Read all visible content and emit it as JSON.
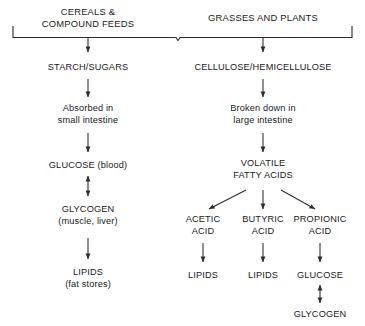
{
  "diagram": {
    "type": "flowchart",
    "background_color": "#ffffff",
    "line_color": "#2b2b2b",
    "text_color": "#1a1a1a"
  },
  "sources": {
    "left": {
      "line1": "CEREALS &",
      "line2": "COMPOUND FEEDS"
    },
    "right": {
      "line1": "GRASSES AND PLANTS",
      "line2": ""
    }
  },
  "left_branch": {
    "step1": {
      "line1": "STARCH/SUGARS",
      "line2": ""
    },
    "step2": {
      "line1": "Absorbed in",
      "line2": "small intestine"
    },
    "step3": {
      "line1": "GLUCOSE (blood)",
      "line2": ""
    },
    "step4": {
      "line1": "GLYCOGEN",
      "line2": "(muscle, liver)"
    },
    "step5": {
      "line1": "LIPIDS",
      "line2": "(fat stores)"
    }
  },
  "right_branch": {
    "step1": {
      "line1": "CELLULOSE/HEMICELLULOSE",
      "line2": ""
    },
    "step2": {
      "line1": "Broken down in",
      "line2": "large intestine"
    },
    "step3": {
      "line1": "VOLATILE",
      "line2": "FATTY ACIDS"
    }
  },
  "acids": [
    {
      "name": {
        "line1": "ACETIC",
        "line2": "ACID"
      },
      "product": {
        "line1": "LIPIDS",
        "line2": ""
      }
    },
    {
      "name": {
        "line1": "BUTYRIC",
        "line2": "ACID"
      },
      "product": {
        "line1": "LIPIDS",
        "line2": ""
      }
    },
    {
      "name": {
        "line1": "PROPIONIC",
        "line2": "ACID"
      },
      "product": {
        "line1": "GLUCOSE",
        "line2": ""
      }
    }
  ],
  "propionic_end": {
    "line1": "GLYCOGEN",
    "line2": ""
  }
}
